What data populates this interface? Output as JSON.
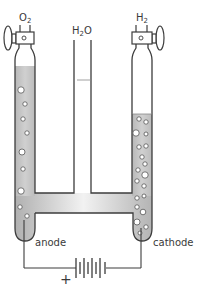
{
  "diagram": {
    "labels": {
      "left_gas": {
        "base": "O",
        "sub": "2"
      },
      "right_gas": {
        "base": "H",
        "sub": "2"
      },
      "center": {
        "base": "H",
        "sub": "2",
        "tail": "O"
      },
      "anode": "anode",
      "cathode": "cathode",
      "positive_terminal": "+"
    },
    "colors": {
      "outline": "#3c3c3c",
      "liquid": "#c4c4c4",
      "liquid_highlight": "#eeeeee",
      "bubble_fill": "#ffffff",
      "background": "#ffffff"
    },
    "components": [
      "anode tube (oxygen collected)",
      "central reservoir tube",
      "cathode tube (hydrogen collected)",
      "stopcock valves",
      "electrodes",
      "battery"
    ]
  }
}
